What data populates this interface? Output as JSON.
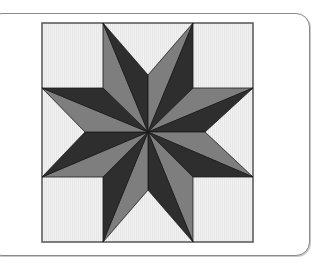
{
  "figure": {
    "colors": {
      "background": "#efefef",
      "dark": "#2e2e2e",
      "medium": "#7e7e7e",
      "outline": "#1a1a1a",
      "frame": "#555555"
    },
    "star_points": 8,
    "halves_pattern": [
      "medium",
      "dark"
    ]
  }
}
